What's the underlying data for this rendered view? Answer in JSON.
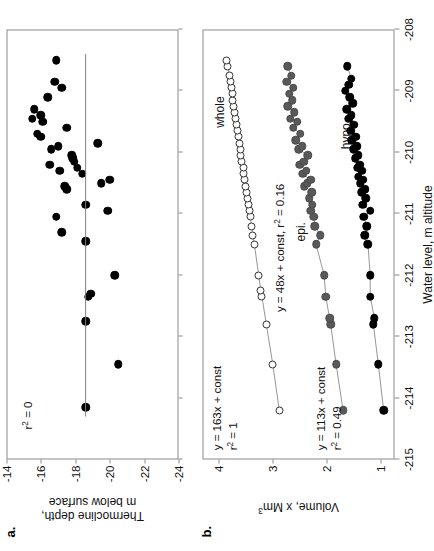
{
  "figure": {
    "panels": [
      {
        "letter": "a.",
        "ylabel": "Thermocline depth,\nm below surface",
        "yticks": [
          "-14",
          "-16",
          "-18",
          "-20",
          "-22",
          "-24"
        ],
        "annotation": "r² = 0"
      },
      {
        "letter": "b.",
        "ylabel": "Volume, x Mm³",
        "yticks": [
          "1",
          "2",
          "3",
          "4"
        ],
        "series_labels": [
          "whole",
          "epi.",
          "hypo."
        ],
        "equations": [
          "y = 163x + const",
          "r² = 1",
          "y = 48x + const, r² = 0.16",
          "y = 113x + const",
          "r² = 0.49"
        ]
      }
    ],
    "xlabel": "Water level, m altitude",
    "xticks": [
      "-215",
      "-214",
      "-213",
      "-212",
      "-211",
      "-210",
      "-209",
      "-208"
    ],
    "colors": {
      "black": "#000000",
      "gray": "#595959",
      "open": "#ffffff",
      "axis": "#8a8a8a"
    }
  },
  "chart_data": [
    {
      "type": "scatter",
      "title": "a.",
      "xlabel": "Water level, m altitude",
      "ylabel": "Thermocline depth, m below surface",
      "xlim": [
        -215,
        -208
      ],
      "ylim": [
        -24,
        -14
      ],
      "xticks": [
        -215,
        -214,
        -213,
        -212,
        -211,
        -210,
        -209,
        -208
      ],
      "yticks": [
        -14,
        -16,
        -18,
        -20,
        -22,
        -24
      ],
      "grid": false,
      "legend": null,
      "annotations": [
        "r² = 0"
      ],
      "fit_line": {
        "label": "r² = 0",
        "x": [
          -214.3,
          -208.4
        ],
        "y": [
          -18.6,
          -18.6
        ]
      },
      "series": [
        {
          "name": "thermocline depth",
          "marker": "filled-circle",
          "color": "#000000",
          "points": [
            [
              -214.15,
              -18.6
            ],
            [
              -213.45,
              -20.5
            ],
            [
              -212.75,
              -18.6
            ],
            [
              -212.35,
              -18.75
            ],
            [
              -212.3,
              -18.9
            ],
            [
              -212.0,
              -20.3
            ],
            [
              -211.45,
              -18.6
            ],
            [
              -211.3,
              -17.2
            ],
            [
              -211.05,
              -16.9
            ],
            [
              -210.95,
              -19.9
            ],
            [
              -210.85,
              -18.6
            ],
            [
              -210.6,
              -17.5
            ],
            [
              -210.55,
              -17.4
            ],
            [
              -210.5,
              -19.5
            ],
            [
              -210.45,
              -20.0
            ],
            [
              -210.35,
              -18.4
            ],
            [
              -210.3,
              -17.1
            ],
            [
              -210.25,
              -18.1
            ],
            [
              -210.2,
              -16.5
            ],
            [
              -210.15,
              -17.95
            ],
            [
              -210.1,
              -17.85
            ],
            [
              -210.05,
              -17.8
            ],
            [
              -209.95,
              -16.6
            ],
            [
              -209.9,
              -17.0
            ],
            [
              -209.85,
              -19.3
            ],
            [
              -209.75,
              -16.0
            ],
            [
              -209.7,
              -15.8
            ],
            [
              -209.6,
              -17.5
            ],
            [
              -209.5,
              -16.1
            ],
            [
              -209.45,
              -15.5
            ],
            [
              -209.4,
              -16.0
            ],
            [
              -209.3,
              -15.6
            ],
            [
              -209.1,
              -16.4
            ],
            [
              -208.95,
              -17.2
            ],
            [
              -208.85,
              -16.8
            ],
            [
              -208.5,
              -16.9
            ]
          ]
        }
      ]
    },
    {
      "type": "scatter",
      "title": "b.",
      "xlabel": "Water level, m altitude",
      "ylabel": "Volume, x Mm³",
      "xlim": [
        -215,
        -208
      ],
      "ylim": [
        0.75,
        4.3
      ],
      "xticks": [
        -215,
        -214,
        -213,
        -212,
        -211,
        -210,
        -209,
        -208
      ],
      "yticks": [
        1,
        2,
        3,
        4
      ],
      "grid": false,
      "legend": "inline labels",
      "annotations": [
        "y = 163x + const",
        "r² = 1",
        "y = 48x + const, r² = 0.16",
        "y = 113x + const",
        "r² = 0.49"
      ],
      "series": [
        {
          "name": "whole",
          "marker": "open-circle",
          "color": "#ffffff",
          "equation": "y = 163x + const",
          "r2": 1,
          "points": [
            [
              -214.2,
              2.88
            ],
            [
              -213.45,
              3.0
            ],
            [
              -212.8,
              3.12
            ],
            [
              -212.35,
              3.2
            ],
            [
              -212.25,
              3.22
            ],
            [
              -212.0,
              3.26
            ],
            [
              -211.5,
              3.34
            ],
            [
              -211.35,
              3.37
            ],
            [
              -211.2,
              3.39
            ],
            [
              -211.05,
              3.42
            ],
            [
              -210.95,
              3.44
            ],
            [
              -210.85,
              3.45
            ],
            [
              -210.75,
              3.47
            ],
            [
              -210.65,
              3.49
            ],
            [
              -210.55,
              3.5
            ],
            [
              -210.45,
              3.52
            ],
            [
              -210.35,
              3.54
            ],
            [
              -210.25,
              3.55
            ],
            [
              -210.15,
              3.57
            ],
            [
              -210.05,
              3.59
            ],
            [
              -209.95,
              3.6
            ],
            [
              -209.85,
              3.62
            ],
            [
              -209.75,
              3.64
            ],
            [
              -209.65,
              3.65
            ],
            [
              -209.55,
              3.67
            ],
            [
              -209.45,
              3.69
            ],
            [
              -209.35,
              3.7
            ],
            [
              -209.25,
              3.72
            ],
            [
              -209.15,
              3.74
            ],
            [
              -209.05,
              3.75
            ],
            [
              -208.95,
              3.77
            ],
            [
              -208.85,
              3.79
            ],
            [
              -208.75,
              3.8
            ],
            [
              -208.6,
              3.83
            ],
            [
              -208.5,
              3.85
            ]
          ]
        },
        {
          "name": "epi.",
          "marker": "filled-circle",
          "color": "#595959",
          "equation": "y = 48x + const",
          "r2": 0.16,
          "points": [
            [
              -214.2,
              1.7
            ],
            [
              -213.45,
              1.83
            ],
            [
              -212.8,
              1.93
            ],
            [
              -212.7,
              1.95
            ],
            [
              -212.35,
              2.02
            ],
            [
              -212.0,
              2.05
            ],
            [
              -211.5,
              2.2
            ],
            [
              -211.35,
              2.12
            ],
            [
              -211.2,
              2.22
            ],
            [
              -211.05,
              2.24
            ],
            [
              -210.95,
              2.3
            ],
            [
              -210.85,
              2.27
            ],
            [
              -210.75,
              2.33
            ],
            [
              -210.65,
              2.28
            ],
            [
              -210.55,
              2.42
            ],
            [
              -210.5,
              2.36
            ],
            [
              -210.45,
              2.3
            ],
            [
              -210.35,
              2.45
            ],
            [
              -210.3,
              2.38
            ],
            [
              -210.2,
              2.5
            ],
            [
              -210.15,
              2.43
            ],
            [
              -210.05,
              2.35
            ],
            [
              -209.95,
              2.52
            ],
            [
              -209.9,
              2.46
            ],
            [
              -209.8,
              2.58
            ],
            [
              -209.7,
              2.49
            ],
            [
              -209.6,
              2.62
            ],
            [
              -209.5,
              2.55
            ],
            [
              -209.45,
              2.68
            ],
            [
              -209.35,
              2.6
            ],
            [
              -209.25,
              2.72
            ],
            [
              -209.15,
              2.64
            ],
            [
              -209.05,
              2.7
            ],
            [
              -208.95,
              2.62
            ],
            [
              -208.85,
              2.74
            ],
            [
              -208.75,
              2.66
            ],
            [
              -208.6,
              2.72
            ]
          ]
        },
        {
          "name": "hypo.",
          "marker": "filled-circle",
          "color": "#000000",
          "equation": "y = 113x + const",
          "r2": 0.49,
          "points": [
            [
              -214.2,
              0.95
            ],
            [
              -213.45,
              1.05
            ],
            [
              -212.8,
              1.14
            ],
            [
              -212.7,
              1.12
            ],
            [
              -212.35,
              1.2
            ],
            [
              -212.0,
              1.2
            ],
            [
              -211.5,
              1.24
            ],
            [
              -211.35,
              1.3
            ],
            [
              -211.2,
              1.26
            ],
            [
              -211.05,
              1.32
            ],
            [
              -210.95,
              1.2
            ],
            [
              -210.85,
              1.34
            ],
            [
              -210.75,
              1.28
            ],
            [
              -210.65,
              1.36
            ],
            [
              -210.6,
              1.3
            ],
            [
              -210.5,
              1.38
            ],
            [
              -210.45,
              1.33
            ],
            [
              -210.4,
              1.42
            ],
            [
              -210.3,
              1.36
            ],
            [
              -210.25,
              1.44
            ],
            [
              -210.2,
              1.39
            ],
            [
              -210.1,
              1.48
            ],
            [
              -210.05,
              1.42
            ],
            [
              -209.95,
              1.5
            ],
            [
              -209.9,
              1.45
            ],
            [
              -209.8,
              1.54
            ],
            [
              -209.75,
              1.47
            ],
            [
              -209.65,
              1.56
            ],
            [
              -209.55,
              1.5
            ],
            [
              -209.45,
              1.6
            ],
            [
              -209.4,
              1.55
            ],
            [
              -209.3,
              1.63
            ],
            [
              -209.2,
              1.52
            ],
            [
              -209.1,
              1.58
            ],
            [
              -209.0,
              1.66
            ],
            [
              -208.9,
              1.6
            ],
            [
              -208.8,
              1.55
            ],
            [
              -208.6,
              1.62
            ]
          ]
        }
      ]
    }
  ]
}
